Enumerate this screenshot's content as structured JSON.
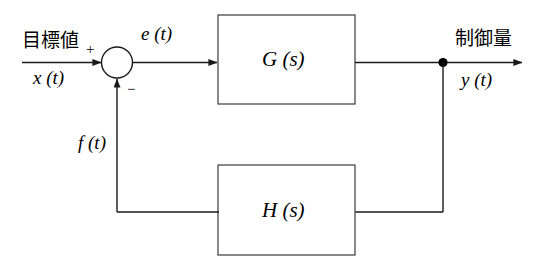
{
  "diagram": {
    "type": "feedback-control-block-diagram",
    "colors": {
      "background": "#ffffff",
      "line": "#1a1a1a",
      "text": "#000000"
    },
    "input": {
      "japanese_label": "目標値",
      "signal_label": "x (t)"
    },
    "summing_junction": {
      "positive_sign": "+",
      "negative_sign": "−"
    },
    "error_signal": {
      "label": "e (t)"
    },
    "forward_block": {
      "label": "G (s)"
    },
    "output": {
      "japanese_label": "制御量",
      "signal_label": "y (t)"
    },
    "feedback_signal": {
      "label": "f (t)"
    },
    "feedback_block": {
      "label": "H (s)"
    }
  }
}
